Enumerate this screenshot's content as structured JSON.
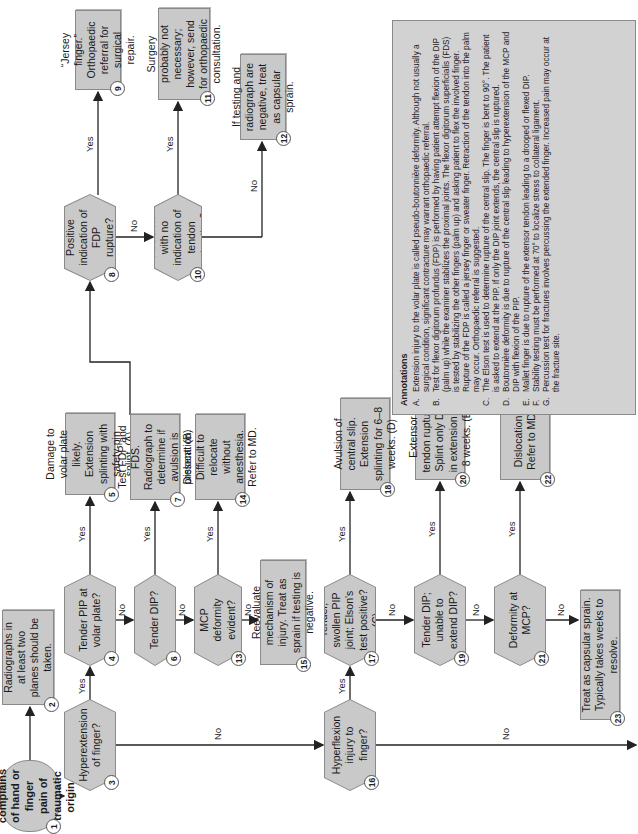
{
  "nodes": {
    "n1": {
      "num": "1",
      "text": "Patient complains of hand or finger pain of traumatic origin."
    },
    "n2": {
      "num": "2",
      "text": "Radiographs in at least two planes should be taken."
    },
    "n3": {
      "num": "3",
      "text": "Hyperextension of finger?"
    },
    "n4": {
      "num": "4",
      "text": "Tender PIP at volar plate?"
    },
    "n5": {
      "num": "5",
      "text": "Damage to volar plate likely. Extension splinting with safety-pin splint. (A)"
    },
    "n6": {
      "num": "6",
      "text": "Tender DIP?"
    },
    "n7": {
      "num": "7",
      "text": "Test FDP and FDS. Radiograph to determine if avulsion is present. (B)"
    },
    "n8": {
      "num": "8",
      "text": "Positive indication of FDP rupture?"
    },
    "n9": {
      "num": "9",
      "text": "“Jersey finger.” Orthopaedic referral for surgical repair."
    },
    "n10": {
      "num": "10",
      "text": "Avulsion with no indication of tendon retraction?"
    },
    "n11": {
      "num": "11",
      "text": "Surgery probably not necessary; however, send for orthopaedic consultation."
    },
    "n12": {
      "num": "12",
      "text": "If testing and radiograph are negative, treat as capsular sprain."
    },
    "n13": {
      "num": "13",
      "text": "MCP deformity evident?"
    },
    "n14": {
      "num": "14",
      "text": "Dislocation. Difficult to relocate without anesthesia. Refer to MD."
    },
    "n15": {
      "num": "15",
      "text": "Reevaluate mechanism of injury. Treat as sprain if testing is negative."
    },
    "n16": {
      "num": "16",
      "text": "Hyperflexion injury to finger?"
    },
    "n17": {
      "num": "17",
      "text": "Tender, swollen PIP joint; Elson's test positive? (C)"
    },
    "n18": {
      "num": "18",
      "text": "Avulsion of central slip. Extension splinting for 6–8 weeks. (D)"
    },
    "n19": {
      "num": "19",
      "text": "Tender DIP; unable to extend DIP?"
    },
    "n20": {
      "num": "20",
      "text": "Extensor tendon rupture. Splint only DIP in extension 6–8 weeks. (E)"
    },
    "n21": {
      "num": "21",
      "text": "Deformity at MCP?"
    },
    "n22": {
      "num": "22",
      "text": "Dislocation. Refer to MD."
    },
    "n23": {
      "num": "23",
      "text": "Treat as capsular sprain. Typically takes weeks to resolve."
    }
  },
  "labels": {
    "yes": "Yes",
    "no": "No"
  },
  "annotations": {
    "title": "Annotations",
    "items": [
      {
        "letter": "A.",
        "text": "Extension injury to the volar plate is called pseudo-boutonnière deformity. Although not usually a surgical condition, significant contracture may warrant orthopaedic referral."
      },
      {
        "letter": "B.",
        "text": "Test for flexor digitorum profundus (FDP) is performed by having patient attempt flexion of the DIP (palm up) while the examiner stabilizes the proximal joints. The flexor digitorum superficialis (FDS) is tested by stabilizing the other fingers (palm up) and asking patient to flex the involved finger. Rupture of the FDP is called a jersey finger or sweater finger. Retraction of the tendon into the palm may occur. Orthopaedic referral is suggested."
      },
      {
        "letter": "C.",
        "text": "The Elson test is used to determine rupture of the central slip. The finger is bent to 90°. The patient is asked to extend at the PIP. If only the DIP joint extends, the central slip is ruptured."
      },
      {
        "letter": "D.",
        "text": "Boutonnière deformity is due to rupture of the central slip leading to hyperextension of the MCP and DIP with flexion of the PIP."
      },
      {
        "letter": "E.",
        "text": "Mallet finger is due to rupture of the extensor tendon leading to a drooped or flexed DIP."
      },
      {
        "letter": "F.",
        "text": "Stability testing must be performed at 70° to localize stress to collateral ligament."
      },
      {
        "letter": "G.",
        "text": "Percussion test for fractures involves percussing the extended finger. Increased pain may occur at the fracture site."
      }
    ]
  },
  "colors": {
    "box_fill": "#c9c9c9",
    "border": "#8a8a8a",
    "line": "#222222",
    "annot_fill": "#d2d2d2"
  }
}
